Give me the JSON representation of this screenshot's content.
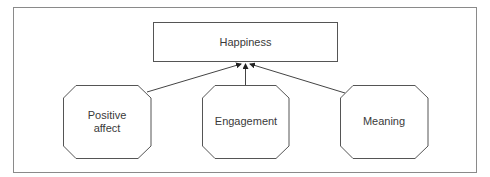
{
  "diagram": {
    "title": "Happiness",
    "nodes": {
      "happiness": {
        "label": "Happiness"
      },
      "positive_affect": {
        "label_line1": "Positive",
        "label_line2": "affect"
      },
      "engagement": {
        "label": "Engagement"
      },
      "meaning": {
        "label": "Meaning"
      }
    },
    "edges": [
      {
        "from": "Positive affect",
        "to": "Happiness"
      },
      {
        "from": "Engagement",
        "to": "Happiness"
      },
      {
        "from": "Meaning",
        "to": "Happiness"
      }
    ],
    "colors": {
      "stroke": "#555555",
      "frame": "#8a8a8a",
      "text": "#3a3a3a",
      "background": "#ffffff"
    }
  }
}
